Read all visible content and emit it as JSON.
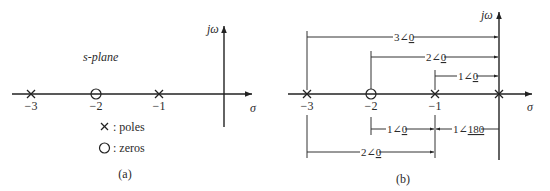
{
  "panel_a": {
    "caption": "(a)",
    "plane_label": "s-plane",
    "axis_labels": {
      "imaginary": "jω",
      "real": "σ"
    },
    "ticks": [
      "−3",
      "−2",
      "−1"
    ],
    "poles": [
      {
        "value": -3,
        "label": "−3"
      },
      {
        "value": -1,
        "label": "−1"
      }
    ],
    "zeros": [
      {
        "value": -2,
        "label": "−2"
      }
    ],
    "legend": {
      "poles_symbol": "X",
      "poles_text": ":  poles",
      "zeros_symbol": "O",
      "zeros_text": ":  zeros"
    }
  },
  "panel_b": {
    "caption": "(b)",
    "axis_labels": {
      "imaginary": "jω",
      "real": "σ"
    },
    "ticks": [
      "−3",
      "−2",
      "−1"
    ],
    "poles": [
      {
        "value": -3
      },
      {
        "value": -1
      },
      {
        "value": 0
      }
    ],
    "zeros": [
      {
        "value": -2
      }
    ],
    "vectors_to_origin": [
      {
        "from": "−3",
        "to": "0",
        "magnitude": "3",
        "angle": "0"
      },
      {
        "from": "−2",
        "to": "0",
        "magnitude": "2",
        "angle": "0"
      },
      {
        "from": "−1",
        "to": "0",
        "magnitude": "1",
        "angle": "0"
      }
    ],
    "vectors_to_minus_one": [
      {
        "from": "−2",
        "to": "−1",
        "magnitude": "1",
        "angle": "0"
      },
      {
        "from": "0",
        "to": "−1",
        "magnitude": "1",
        "angle": "180"
      },
      {
        "from": "−3",
        "to": "−1",
        "magnitude": "2",
        "angle": "0"
      }
    ],
    "angle_symbol": "∠"
  }
}
